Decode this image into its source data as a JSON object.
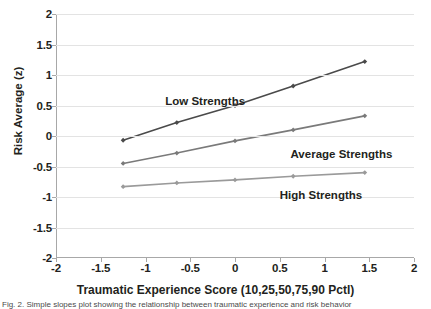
{
  "chart_data": {
    "type": "line",
    "title": "",
    "xlabel": "Traumatic Experience Score (10,25,50,75,90 Pctl)",
    "ylabel": "Risk Average (z)",
    "xlim": [
      -2,
      2
    ],
    "ylim": [
      -2,
      2
    ],
    "grid": "horizontal",
    "legend_position": "inline-labels",
    "x": [
      -1.25,
      -0.65,
      0,
      0.65,
      1.45
    ],
    "xticks": [
      "-2",
      "-1.5",
      "-1",
      "-0.5",
      "0",
      "0.5",
      "1",
      "1.5",
      "2"
    ],
    "xtick_values": [
      -2,
      -1.5,
      -1,
      -0.5,
      0,
      0.5,
      1,
      1.5,
      2
    ],
    "yticks": [
      "-2",
      "-1.5",
      "-1",
      "-0.5",
      "0",
      "0.5",
      "1",
      "1.5",
      "2"
    ],
    "ytick_values": [
      -2,
      -1.5,
      -1,
      -0.5,
      0,
      0.5,
      1,
      1.5,
      2
    ],
    "series": [
      {
        "name": "Low Strengths",
        "color": "#4a4a4a",
        "values": [
          -0.07,
          0.22,
          0.5,
          0.82,
          1.22
        ],
        "label_x": -0.78,
        "label_y": 0.56
      },
      {
        "name": "Average Strengths",
        "color": "#7a7a7a",
        "values": [
          -0.45,
          -0.28,
          -0.08,
          0.1,
          0.33
        ],
        "label_x": 0.62,
        "label_y": -0.31
      },
      {
        "name": "High Strengths",
        "color": "#9a9a9a",
        "values": [
          -0.83,
          -0.77,
          -0.72,
          -0.66,
          -0.6
        ],
        "label_x": 0.5,
        "label_y": -0.99
      }
    ]
  },
  "axes": {
    "y_title": "Risk Average (z)",
    "x_title": "Traumatic Experience Score (10,25,50,75,90 Pctl)"
  },
  "caption": {
    "text": "Fig. 2. Simple slopes plot showing the relationship between traumatic experience and risk behavior"
  }
}
